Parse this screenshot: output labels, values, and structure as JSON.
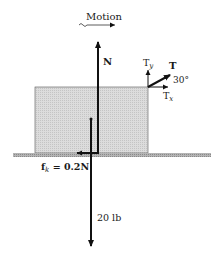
{
  "diagram": {
    "motion_label": "Motion",
    "forces": {
      "normal": {
        "label": "N",
        "direction": "up"
      },
      "weight": {
        "label": "20 lb",
        "direction": "down"
      },
      "friction": {
        "label_main": "f",
        "label_sub": "k",
        "label_rest": " = 0.2N",
        "direction": "left"
      },
      "tension": {
        "label": "T",
        "angle_label": "30°",
        "direction": "up-right"
      },
      "tension_x": {
        "label_main": "T",
        "label_sub": "x"
      },
      "tension_y": {
        "label_main": "T",
        "label_sub": "y"
      }
    },
    "colors": {
      "block_fill": "#d4d4d4",
      "ground_fill": "#a8a8a8",
      "arrow": "#111111"
    }
  }
}
